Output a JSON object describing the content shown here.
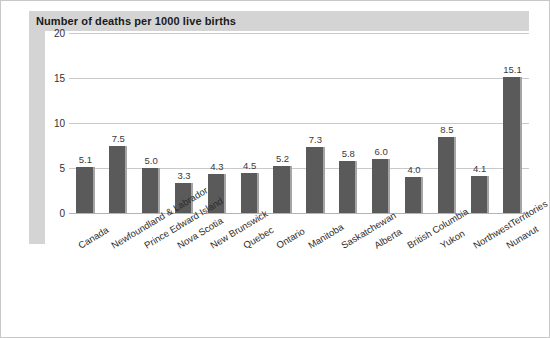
{
  "figure": {
    "title": "Number of deaths per 1000 live births"
  },
  "chart_data": {
    "type": "bar",
    "title": "Number of deaths per 1000 live births",
    "xlabel": "",
    "ylabel": "",
    "ylim": [
      0,
      20
    ],
    "yticks": [
      "0",
      "5",
      "10",
      "15",
      "20"
    ],
    "ytick_values": [
      0,
      5,
      10,
      15,
      20
    ],
    "grid": true,
    "legend": "none",
    "bar_color": "#5a5a5a",
    "categories": [
      "Canada",
      "Newfoundland & Labrador",
      "Prince Edward Island",
      "Nova Scotia",
      "New Brunswick",
      "Quebec",
      "Ontario",
      "Manitoba",
      "Saskatchewan",
      "Alberta",
      "British Columbia",
      "Yukon",
      "NorthwestTerritories",
      "Nunavut"
    ],
    "values": [
      5.1,
      7.5,
      5.0,
      3.3,
      4.3,
      4.5,
      5.2,
      7.3,
      5.8,
      6.0,
      4.0,
      8.5,
      4.1,
      15.1
    ],
    "data_labels": [
      "5.1",
      "7.5",
      "5.0",
      "3.3",
      "4.3",
      "4.5",
      "5.2",
      "7.3",
      "5.8",
      "6.0",
      "4.0",
      "8.5",
      "4.1",
      "15.1"
    ]
  }
}
